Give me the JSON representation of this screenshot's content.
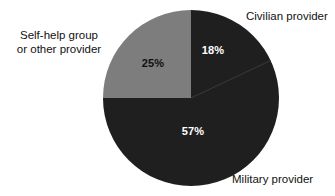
{
  "chart_data": {
    "type": "pie",
    "title": "",
    "subtitle": "",
    "xlabel": "",
    "ylabel": "",
    "legend_position": "callout-labels",
    "grid": false,
    "start_angle_deg": 0,
    "direction": "clockwise",
    "categories": [
      "Civilian provider",
      "Military provider",
      "Self-help group or other provider"
    ],
    "values": [
      18,
      57,
      25
    ],
    "value_unit": "%",
    "slices": [
      {
        "name": "civilian",
        "label": "Civilian provider",
        "value": 18,
        "value_label": "18%",
        "color": "#1f1f1f",
        "value_text_color": "#ffffff",
        "start_angle_deg": 0,
        "end_angle_deg": 64.8
      },
      {
        "name": "military",
        "label": "Military provider",
        "value": 57,
        "value_label": "57%",
        "color": "#1f1f1f",
        "value_text_color": "#ffffff",
        "start_angle_deg": 64.8,
        "end_angle_deg": 270
      },
      {
        "name": "selfhelp",
        "label_line1": "Self-help group",
        "label_line2": "or other provider",
        "label": "Self-help group or other provider",
        "value": 25,
        "value_label": "25%",
        "color": "#7d7d7d",
        "value_text_color": "#111111",
        "start_angle_deg": 270,
        "end_angle_deg": 360
      }
    ]
  },
  "colors": {
    "background": "#ffffff",
    "dark_slice": "#1f1f1f",
    "gray_slice": "#7d7d7d",
    "slice_divider": "#3a3a3a",
    "label_text": "#111111",
    "value_text_on_dark": "#ffffff",
    "value_text_on_light": "#111111"
  }
}
